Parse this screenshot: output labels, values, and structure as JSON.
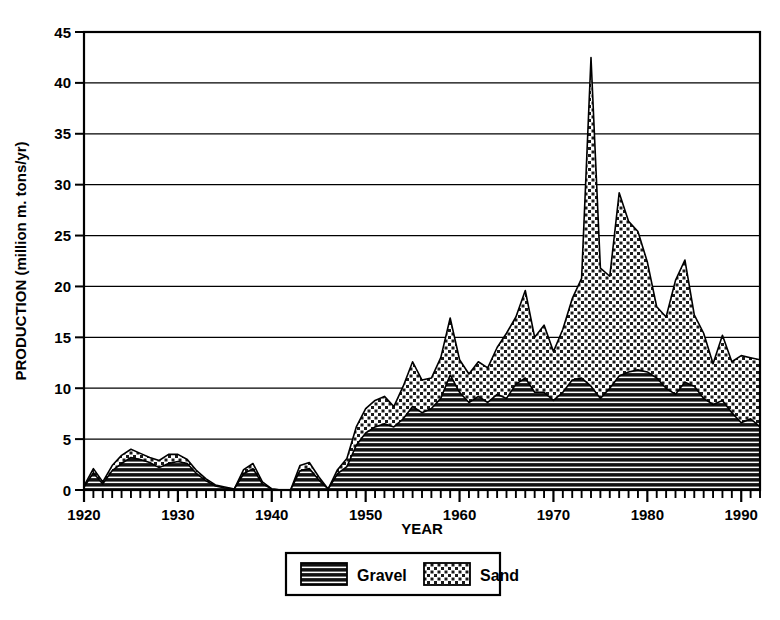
{
  "chart_data": {
    "type": "area",
    "stacked": true,
    "title": "",
    "xlabel": "YEAR",
    "ylabel": "PRODUCTION (million m. tons/yr)",
    "xlim": [
      1920,
      1992
    ],
    "ylim": [
      0,
      45
    ],
    "xticks": [
      1920,
      1930,
      1940,
      1950,
      1960,
      1970,
      1980,
      1990
    ],
    "xtick_labels": [
      "1920",
      "1930",
      "1940",
      "1950",
      "1960",
      "1970",
      "1980",
      "1990"
    ],
    "x_minor_tick_interval": 1,
    "yticks": [
      0,
      5,
      10,
      15,
      20,
      25,
      30,
      35,
      40,
      45
    ],
    "ytick_labels": [
      "0",
      "5",
      "10",
      "15",
      "20",
      "25",
      "30",
      "35",
      "40",
      "45"
    ],
    "grid": "horizontal",
    "legend_position": "below-center",
    "x": [
      1920,
      1921,
      1922,
      1923,
      1924,
      1925,
      1926,
      1927,
      1928,
      1929,
      1930,
      1931,
      1932,
      1933,
      1934,
      1935,
      1936,
      1937,
      1938,
      1939,
      1940,
      1941,
      1942,
      1943,
      1944,
      1945,
      1946,
      1947,
      1948,
      1949,
      1950,
      1951,
      1952,
      1953,
      1954,
      1955,
      1956,
      1957,
      1958,
      1959,
      1960,
      1961,
      1962,
      1963,
      1964,
      1965,
      1966,
      1967,
      1968,
      1969,
      1970,
      1971,
      1972,
      1973,
      1974,
      1975,
      1976,
      1977,
      1978,
      1979,
      1980,
      1981,
      1982,
      1983,
      1984,
      1985,
      1986,
      1987,
      1988,
      1989,
      1990,
      1991,
      1992
    ],
    "series": [
      {
        "name": "Gravel",
        "fill_pattern": "horizontal-lines",
        "values": [
          0.3,
          1.7,
          0.6,
          1.9,
          2.6,
          3.2,
          3.0,
          2.7,
          2.2,
          2.6,
          2.8,
          2.6,
          1.6,
          0.9,
          0.4,
          0.2,
          0.1,
          1.6,
          2.1,
          0.6,
          0.1,
          0.0,
          0.0,
          1.9,
          2.1,
          1.0,
          0.1,
          1.6,
          2.3,
          4.4,
          5.6,
          6.2,
          6.5,
          6.2,
          7.0,
          8.2,
          7.6,
          8.0,
          9.0,
          11.3,
          9.6,
          8.6,
          9.2,
          8.6,
          9.4,
          9.0,
          10.4,
          11.0,
          9.6,
          9.6,
          8.8,
          9.6,
          10.8,
          11.0,
          10.2,
          9.0,
          10.0,
          11.2,
          11.6,
          11.8,
          11.6,
          11.0,
          10.0,
          9.4,
          10.6,
          10.2,
          9.0,
          8.4,
          8.8,
          7.6,
          6.6,
          7.0,
          6.2
        ]
      },
      {
        "name": "Sand",
        "fill_pattern": "cross-hatch-dots",
        "values": [
          0.1,
          0.4,
          0.2,
          0.5,
          0.8,
          0.8,
          0.6,
          0.5,
          0.7,
          0.9,
          0.7,
          0.4,
          0.3,
          0.2,
          0.1,
          0.1,
          0.0,
          0.4,
          0.5,
          0.2,
          0.0,
          0.0,
          0.0,
          0.5,
          0.6,
          0.3,
          0.0,
          0.4,
          0.8,
          1.8,
          2.4,
          2.6,
          2.7,
          2.0,
          3.2,
          4.4,
          3.2,
          3.0,
          4.0,
          5.6,
          3.2,
          2.8,
          3.4,
          3.4,
          4.6,
          6.4,
          6.6,
          8.6,
          5.4,
          6.6,
          4.8,
          6.2,
          8.0,
          9.8,
          32.3,
          12.8,
          11.0,
          18.0,
          14.8,
          13.6,
          10.8,
          7.0,
          7.0,
          11.2,
          12.0,
          7.0,
          6.4,
          4.0,
          6.4,
          5.0,
          6.6,
          6.0,
          6.6
        ]
      }
    ]
  },
  "legend": {
    "items": [
      {
        "label": "Gravel",
        "pattern": "horizontal-lines"
      },
      {
        "label": "Sand",
        "pattern": "cross-hatch-dots"
      }
    ]
  },
  "colors": {
    "foreground": "#000000",
    "background": "#ffffff",
    "gravel_fill": "#1a1a1a",
    "sand_fill": "#d8d8d8"
  }
}
